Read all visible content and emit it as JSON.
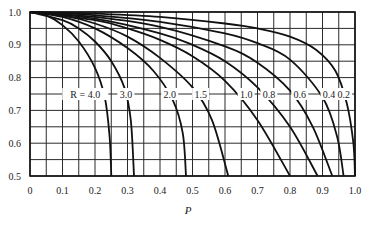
{
  "chart_data": {
    "type": "line",
    "title": "",
    "xlabel": "P",
    "ylabel": "",
    "xlim": [
      0,
      1.0
    ],
    "ylim": [
      0.5,
      1.0
    ],
    "grid": true,
    "x_ticks": [
      "0",
      "0.1",
      "0.2",
      "0.3",
      "0.4",
      "0.5",
      "0.6",
      "0.7",
      "0.8",
      "0.9",
      "1.0"
    ],
    "y_ticks": [
      "0.5",
      "0.6",
      "0.7",
      "0.8",
      "0.9",
      "1.0"
    ],
    "legend_position": "inline labels along y = 0.75",
    "series_label_prefix": "R = ",
    "series": [
      {
        "name": "4.0",
        "label": "R = 4.0",
        "p_at_y_0_5": 0.25,
        "points": [
          [
            0,
            1.0
          ],
          [
            0.05,
            0.99
          ],
          [
            0.1,
            0.96
          ],
          [
            0.15,
            0.91
          ],
          [
            0.2,
            0.83
          ],
          [
            0.23,
            0.74
          ],
          [
            0.245,
            0.62
          ],
          [
            0.25,
            0.5
          ]
        ]
      },
      {
        "name": "3.0",
        "label": "3.0",
        "p_at_y_0_5": 0.32,
        "points": [
          [
            0,
            1.0
          ],
          [
            0.1,
            0.975
          ],
          [
            0.15,
            0.95
          ],
          [
            0.2,
            0.91
          ],
          [
            0.25,
            0.85
          ],
          [
            0.29,
            0.77
          ],
          [
            0.31,
            0.67
          ],
          [
            0.32,
            0.5
          ]
        ]
      },
      {
        "name": "2.0",
        "label": "2.0",
        "p_at_y_0_5": 0.48,
        "points": [
          [
            0,
            1.0
          ],
          [
            0.1,
            0.985
          ],
          [
            0.2,
            0.95
          ],
          [
            0.3,
            0.89
          ],
          [
            0.38,
            0.82
          ],
          [
            0.44,
            0.73
          ],
          [
            0.47,
            0.63
          ],
          [
            0.48,
            0.5
          ]
        ]
      },
      {
        "name": "1.5",
        "label": "1.5",
        "p_at_y_0_5": 0.61,
        "points": [
          [
            0,
            1.0
          ],
          [
            0.1,
            0.99
          ],
          [
            0.2,
            0.965
          ],
          [
            0.3,
            0.925
          ],
          [
            0.4,
            0.86
          ],
          [
            0.5,
            0.77
          ],
          [
            0.56,
            0.67
          ],
          [
            0.61,
            0.5
          ]
        ]
      },
      {
        "name": "1.0",
        "label": "1.0",
        "p_at_y_0_5": 0.8,
        "points": [
          [
            0,
            1.0
          ],
          [
            0.2,
            0.975
          ],
          [
            0.3,
            0.95
          ],
          [
            0.4,
            0.915
          ],
          [
            0.5,
            0.865
          ],
          [
            0.6,
            0.79
          ],
          [
            0.7,
            0.67
          ],
          [
            0.8,
            0.5
          ]
        ]
      },
      {
        "name": "0.8",
        "label": "0.8",
        "p_at_y_0_5": 0.885,
        "points": [
          [
            0,
            1.0
          ],
          [
            0.2,
            0.98
          ],
          [
            0.4,
            0.935
          ],
          [
            0.5,
            0.9
          ],
          [
            0.6,
            0.85
          ],
          [
            0.7,
            0.77
          ],
          [
            0.8,
            0.65
          ],
          [
            0.885,
            0.5
          ]
        ]
      },
      {
        "name": "0.6",
        "label": "0.6",
        "p_at_y_0_5": 0.93,
        "points": [
          [
            0,
            1.0
          ],
          [
            0.2,
            0.985
          ],
          [
            0.4,
            0.955
          ],
          [
            0.6,
            0.895
          ],
          [
            0.7,
            0.845
          ],
          [
            0.8,
            0.76
          ],
          [
            0.87,
            0.65
          ],
          [
            0.93,
            0.5
          ]
        ]
      },
      {
        "name": "0.4",
        "label": "0.4",
        "p_at_y_0_5": 0.965,
        "points": [
          [
            0,
            1.0
          ],
          [
            0.2,
            0.99
          ],
          [
            0.4,
            0.97
          ],
          [
            0.6,
            0.935
          ],
          [
            0.7,
            0.905
          ],
          [
            0.8,
            0.855
          ],
          [
            0.9,
            0.74
          ],
          [
            0.945,
            0.62
          ],
          [
            0.965,
            0.5
          ]
        ]
      },
      {
        "name": "0.2",
        "label": "0.2",
        "p_at_y_0_5": 1.0,
        "points": [
          [
            0,
            1.0
          ],
          [
            0.2,
            0.995
          ],
          [
            0.4,
            0.985
          ],
          [
            0.6,
            0.965
          ],
          [
            0.7,
            0.95
          ],
          [
            0.8,
            0.925
          ],
          [
            0.88,
            0.885
          ],
          [
            0.94,
            0.82
          ],
          [
            0.975,
            0.72
          ],
          [
            0.995,
            0.6
          ],
          [
            1.0,
            0.5
          ]
        ]
      }
    ]
  }
}
